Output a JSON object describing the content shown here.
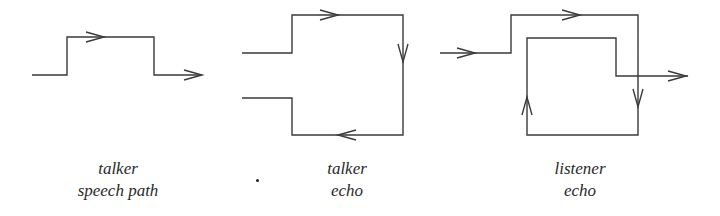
{
  "diagrams": [
    {
      "id": "talker-speech-path",
      "label_line1": "talker",
      "label_line2": "speech path"
    },
    {
      "id": "talker-echo",
      "label_line1": "talker",
      "label_line2": "echo"
    },
    {
      "id": "listener-echo",
      "label_line1": "listener",
      "label_line2": "echo"
    }
  ],
  "colors": {
    "line": "#3a3a3a",
    "text": "#2a2a2a",
    "background": "#ffffff"
  }
}
